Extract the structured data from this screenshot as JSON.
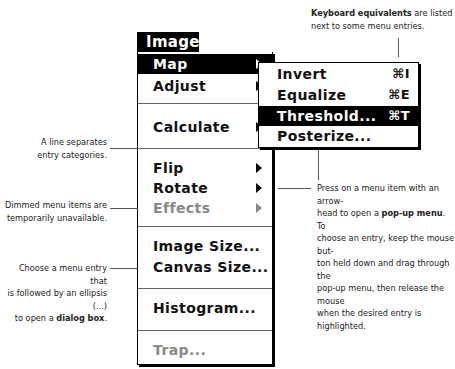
{
  "menu": {
    "title": "Image",
    "items": [
      {
        "label": "Map",
        "submenu": true,
        "highlighted": true,
        "dimmed": false
      },
      {
        "label": "Adjust",
        "submenu": true,
        "highlighted": false,
        "dimmed": false
      },
      {
        "label": "Calculate",
        "submenu": true,
        "highlighted": false,
        "dimmed": false
      },
      {
        "label": "Flip",
        "submenu": true,
        "highlighted": false,
        "dimmed": false
      },
      {
        "label": "Rotate",
        "submenu": true,
        "highlighted": false,
        "dimmed": false
      },
      {
        "label": "Effects",
        "submenu": true,
        "highlighted": false,
        "dimmed": true
      },
      {
        "label": "Image Size...",
        "submenu": false,
        "highlighted": false,
        "dimmed": false
      },
      {
        "label": "Canvas Size...",
        "submenu": false,
        "highlighted": false,
        "dimmed": false
      },
      {
        "label": "Histogram...",
        "submenu": false,
        "highlighted": false,
        "dimmed": false
      },
      {
        "label": "Trap...",
        "submenu": false,
        "highlighted": false,
        "dimmed": true
      }
    ]
  },
  "submenu": {
    "parent": "Map",
    "items": [
      {
        "label": "Invert",
        "shortcut": "⌘I",
        "highlighted": false
      },
      {
        "label": "Equalize",
        "shortcut": "⌘E",
        "highlighted": false
      },
      {
        "label": "Threshold...",
        "shortcut": "⌘T",
        "highlighted": true
      },
      {
        "label": "Posterize...",
        "shortcut": "",
        "highlighted": false
      }
    ]
  },
  "annotations": {
    "keyboard": {
      "bold": "Keyboard equivalents",
      "rest1": " are listed",
      "line2": "next to some menu entries."
    },
    "separator": {
      "line1": "A line separates",
      "line2": "entry categories."
    },
    "dimmed": {
      "line1": "Dimmed menu items are",
      "line2": "temporarily unavailable."
    },
    "ellipsis": {
      "line1": "Choose a menu entry that",
      "line2": "is followed by an ellipsis (...)",
      "line3_pre": "to open a ",
      "line3_bold": "dialog box",
      "line3_post": "."
    },
    "popup": {
      "line1": "Press on a menu item with an arrow-",
      "line2_pre": "head to open a ",
      "line2_bold": "pop-up menu",
      "line2_post": ". To",
      "line3": "choose an entry, keep the mouse but-",
      "line4": "ton held down and drag through the",
      "line5": "pop-up menu, then release the mouse",
      "line6": "when the desired entry is highlighted."
    }
  },
  "colors": {
    "highlight_bg": "#000000",
    "highlight_fg": "#ffffff",
    "dimmed": "#888888"
  }
}
